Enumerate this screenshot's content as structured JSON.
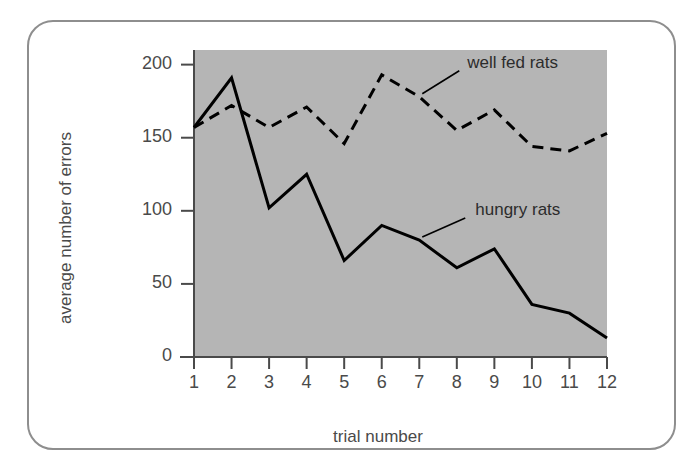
{
  "figure": {
    "frame_color": "#8e8e8e",
    "plot_background": "#b5b5b5",
    "axis_color": "#4a4a4a"
  },
  "chart_data": {
    "type": "line",
    "title": "",
    "subtitle": "",
    "xlabel": "trial number",
    "ylabel": "average number of errors",
    "categories": [
      "1",
      "2",
      "3",
      "4",
      "5",
      "6",
      "7",
      "8",
      "9",
      "10",
      "11",
      "12"
    ],
    "x": [
      1,
      2,
      3,
      4,
      5,
      6,
      7,
      8,
      9,
      10,
      11,
      12
    ],
    "xlim": [
      1,
      12
    ],
    "ylim": [
      0,
      210
    ],
    "ytick_labels": [
      "0",
      "50",
      "100",
      "150",
      "200"
    ],
    "yticks": [
      0,
      50,
      100,
      150,
      200
    ],
    "xtick_labels": [
      "1",
      "2",
      "3",
      "4",
      "5",
      "6",
      "7",
      "8",
      "9",
      "10",
      "11",
      "12"
    ],
    "grid": false,
    "legend_position": "inline-annotation",
    "series": [
      {
        "name": "well fed rats",
        "style": "dashed",
        "color": "#000000",
        "values": [
          157,
          172,
          157,
          171,
          146,
          193,
          178,
          155,
          169,
          144,
          141,
          153
        ]
      },
      {
        "name": "hungry rats",
        "style": "solid",
        "color": "#000000",
        "values": [
          157,
          191,
          102,
          125,
          66,
          90,
          80,
          61,
          74,
          36,
          30,
          13
        ]
      }
    ],
    "annotations": [
      {
        "text": "well fed rats",
        "target_series": "well fed rats",
        "target_x": 7
      },
      {
        "text": "hungry rats",
        "target_series": "hungry rats",
        "target_x": 7
      }
    ]
  }
}
